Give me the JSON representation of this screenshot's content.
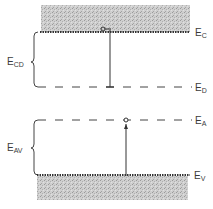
{
  "diagram": {
    "type": "semiconductor-energy-band-diagram",
    "levels": {
      "conduction_band_edge": {
        "symbol": "E",
        "sub": "C"
      },
      "donor_level": {
        "symbol": "E",
        "sub": "D"
      },
      "acceptor_level": {
        "symbol": "E",
        "sub": "A"
      },
      "valence_band_edge": {
        "symbol": "E",
        "sub": "V"
      }
    },
    "gaps": {
      "conduction_to_donor": {
        "symbol": "E",
        "sub": "CD"
      },
      "acceptor_to_valence": {
        "symbol": "E",
        "sub": "AV"
      }
    },
    "transitions": [
      {
        "name": "donor-to-conduction",
        "from": "E_D",
        "to": "E_C",
        "carrier": "electron"
      },
      {
        "name": "valence-to-acceptor",
        "from": "E_V",
        "to": "E_A",
        "carrier": "hole"
      }
    ],
    "colors": {
      "band_fill": "#c8c8c8",
      "line": "#333333",
      "background": "#ffffff"
    }
  }
}
